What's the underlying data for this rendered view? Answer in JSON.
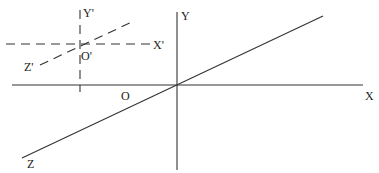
{
  "diagram": {
    "type": "coordinate-frames",
    "colors": {
      "line": "#333333",
      "text": "#222222",
      "background": "#ffffff"
    },
    "world_frame": {
      "origin_label": "O",
      "x_label": "X",
      "y_label": "Y",
      "z_label": "Z",
      "style": "solid"
    },
    "local_frame": {
      "origin_label": "O'",
      "x_label": "X'",
      "y_label": "Y'",
      "z_label": "Z'",
      "style": "dashed"
    }
  }
}
